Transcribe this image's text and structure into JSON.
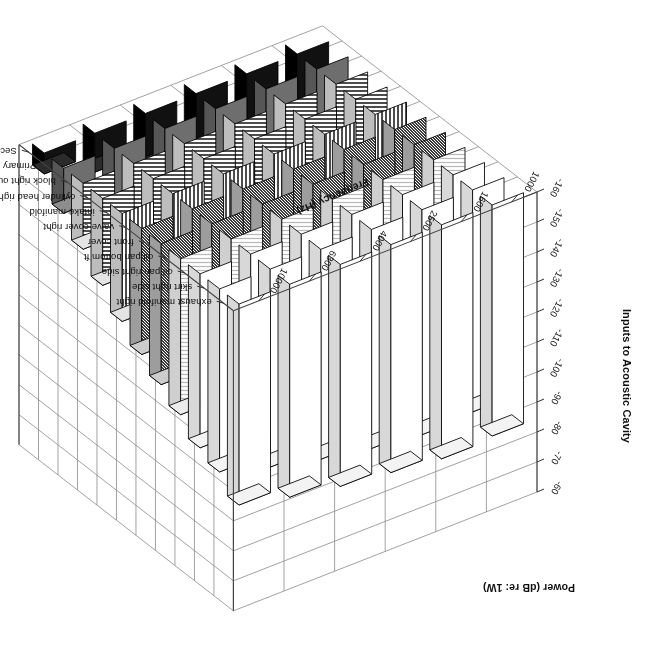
{
  "figure": {
    "title": "Inputs to Acoustic Cavity",
    "subsystem_axis_title": "Subsystem",
    "frequency_axis_title": "Frequency (Hz)",
    "power_axis_title": "Power (dB re: 1W)"
  },
  "chart_data": {
    "type": "bar",
    "subtype": "3d-surface-bar",
    "title": "Inputs to Acoustic Cavity",
    "xlabel": "Frequency (Hz)",
    "ylabel": "Subsystem",
    "zlabel": "Power (dB re: 1W)",
    "grid": true,
    "legend_position": "none",
    "zlim": [
      -160,
      -60
    ],
    "zticks": [
      "-60",
      "-70",
      "-80",
      "-90",
      "-100",
      "-110",
      "-120",
      "-130",
      "-140",
      "-150",
      "-160"
    ],
    "categories": [
      "1000",
      "1600",
      "2500",
      "4000",
      "6300",
      "10000"
    ],
    "xticklabels": [
      "1000",
      "1600",
      "2500",
      "4000",
      "6300",
      "10000"
    ],
    "yticklabels": [
      "exhaust manifold right",
      "skirt right side",
      "oil pan right side",
      "oil pan bottom ft",
      "front cover",
      "valve cover right",
      "intake manifold",
      "cylinder head right outer",
      "block right outer",
      "Primary intake port",
      "Secondary intake port"
    ],
    "series": [
      {
        "name": "exhaust manifold right",
        "fill": "white",
        "values": [
          -83,
          -82,
          -84,
          -86,
          -89,
          -93
        ]
      },
      {
        "name": "skirt right side",
        "fill": "white",
        "values": [
          -86,
          -85,
          -87,
          -90,
          -94,
          -99
        ]
      },
      {
        "name": "oil pan right side",
        "fill": "white",
        "values": [
          -88,
          -87,
          -90,
          -93,
          -97,
          -102
        ]
      },
      {
        "name": "oil pan bottom ft",
        "fill": "hgray",
        "values": [
          -92,
          -91,
          -94,
          -98,
          -103,
          -108
        ]
      },
      {
        "name": "front cover",
        "fill": "dots",
        "values": [
          -95,
          -96,
          -99,
          -103,
          -108,
          -113
        ]
      },
      {
        "name": "valve cover right",
        "fill": "dots",
        "values": [
          -99,
          -100,
          -103,
          -108,
          -113,
          -118
        ]
      },
      {
        "name": "intake manifold",
        "fill": "vlines",
        "values": [
          -104,
          -105,
          -109,
          -113,
          -118,
          -124
        ]
      },
      {
        "name": "cylinder head right outer",
        "fill": "hlines",
        "values": [
          -109,
          -111,
          -115,
          -119,
          -125,
          -131
        ]
      },
      {
        "name": "block right outer",
        "fill": "hlines",
        "values": [
          -115,
          -117,
          -121,
          -126,
          -132,
          -138
        ]
      },
      {
        "name": "Primary intake port",
        "fill": "gray",
        "values": [
          -121,
          -124,
          -128,
          -133,
          -139,
          -145
        ]
      },
      {
        "name": "Secondary intake port",
        "fill": "black",
        "values": [
          -129,
          -132,
          -136,
          -141,
          -147,
          -153
        ]
      }
    ]
  }
}
